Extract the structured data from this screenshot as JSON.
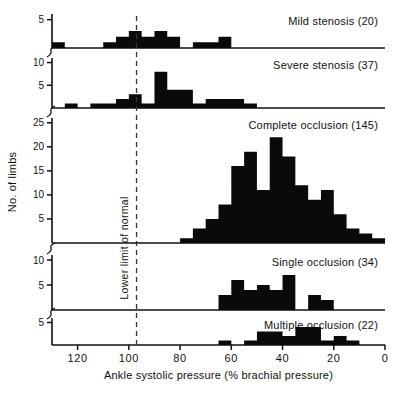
{
  "figure": {
    "ylabel": "No. of limbs",
    "xlabel": "Ankle systolic pressure (% brachial pressure)",
    "normal_limit_label": "Lower limit of normal",
    "normal_limit_value": 97
  },
  "chart_data": {
    "type": "bar",
    "title": "",
    "xlabel": "Ankle systolic pressure (% brachial pressure)",
    "ylabel": "No. of limbs",
    "xlim": [
      130,
      0
    ],
    "x_reversed": true,
    "xticks": [
      120,
      100,
      80,
      60,
      40,
      20,
      0
    ],
    "xticklabels": [
      "120",
      "100",
      "80",
      "60",
      "40",
      "20",
      "0"
    ],
    "grid": false,
    "legend": "none",
    "bin_width": 5,
    "annotations": [
      {
        "text": "Lower limit of normal",
        "x": 97,
        "style": "dashed-vertical-line"
      }
    ],
    "panels": [
      {
        "name": "mild-stenosis",
        "label": "Mild stenosis (20)",
        "count": 20,
        "ylim": [
          0,
          6
        ],
        "yticks": [
          5
        ],
        "yticklabels": [
          "5"
        ],
        "bins": [
          {
            "x0": 130,
            "x1": 125,
            "value": 1
          },
          {
            "x0": 125,
            "x1": 120,
            "value": 0
          },
          {
            "x0": 120,
            "x1": 115,
            "value": 0
          },
          {
            "x0": 115,
            "x1": 110,
            "value": 0
          },
          {
            "x0": 110,
            "x1": 105,
            "value": 1
          },
          {
            "x0": 105,
            "x1": 100,
            "value": 2
          },
          {
            "x0": 100,
            "x1": 95,
            "value": 3
          },
          {
            "x0": 95,
            "x1": 90,
            "value": 2
          },
          {
            "x0": 90,
            "x1": 85,
            "value": 3
          },
          {
            "x0": 85,
            "x1": 80,
            "value": 2
          },
          {
            "x0": 80,
            "x1": 75,
            "value": 0
          },
          {
            "x0": 75,
            "x1": 70,
            "value": 1
          },
          {
            "x0": 70,
            "x1": 65,
            "value": 1
          },
          {
            "x0": 65,
            "x1": 60,
            "value": 2
          },
          {
            "x0": 60,
            "x1": 55,
            "value": 0
          }
        ]
      },
      {
        "name": "severe-stenosis",
        "label": "Severe stenosis (37)",
        "count": 37,
        "ylim": [
          0,
          11
        ],
        "yticks": [
          5,
          10
        ],
        "yticklabels": [
          "5",
          "10"
        ],
        "bins": [
          {
            "x0": 125,
            "x1": 120,
            "value": 1
          },
          {
            "x0": 120,
            "x1": 115,
            "value": 0
          },
          {
            "x0": 115,
            "x1": 110,
            "value": 1
          },
          {
            "x0": 110,
            "x1": 105,
            "value": 1
          },
          {
            "x0": 105,
            "x1": 100,
            "value": 2
          },
          {
            "x0": 100,
            "x1": 95,
            "value": 3
          },
          {
            "x0": 95,
            "x1": 90,
            "value": 1
          },
          {
            "x0": 90,
            "x1": 85,
            "value": 8
          },
          {
            "x0": 85,
            "x1": 80,
            "value": 4
          },
          {
            "x0": 80,
            "x1": 75,
            "value": 4
          },
          {
            "x0": 75,
            "x1": 70,
            "value": 1
          },
          {
            "x0": 70,
            "x1": 65,
            "value": 2
          },
          {
            "x0": 65,
            "x1": 60,
            "value": 2
          },
          {
            "x0": 60,
            "x1": 55,
            "value": 2
          },
          {
            "x0": 55,
            "x1": 50,
            "value": 1
          }
        ]
      },
      {
        "name": "complete-occlusion",
        "label": "Complete occlusion (145)",
        "count": 145,
        "ylim": [
          0,
          26
        ],
        "yticks": [
          5,
          10,
          15,
          20,
          25
        ],
        "yticklabels": [
          "5",
          "10",
          "15",
          "20",
          "25"
        ],
        "bins": [
          {
            "x0": 80,
            "x1": 75,
            "value": 1
          },
          {
            "x0": 75,
            "x1": 70,
            "value": 3
          },
          {
            "x0": 70,
            "x1": 65,
            "value": 5
          },
          {
            "x0": 65,
            "x1": 60,
            "value": 8
          },
          {
            "x0": 60,
            "x1": 55,
            "value": 16
          },
          {
            "x0": 55,
            "x1": 50,
            "value": 19
          },
          {
            "x0": 50,
            "x1": 45,
            "value": 11
          },
          {
            "x0": 45,
            "x1": 40,
            "value": 22
          },
          {
            "x0": 40,
            "x1": 35,
            "value": 18
          },
          {
            "x0": 35,
            "x1": 30,
            "value": 12
          },
          {
            "x0": 30,
            "x1": 25,
            "value": 9
          },
          {
            "x0": 25,
            "x1": 20,
            "value": 11
          },
          {
            "x0": 20,
            "x1": 15,
            "value": 6
          },
          {
            "x0": 15,
            "x1": 10,
            "value": 3
          },
          {
            "x0": 10,
            "x1": 5,
            "value": 2
          },
          {
            "x0": 5,
            "x1": 0,
            "value": 1
          }
        ]
      },
      {
        "name": "single-occlusion",
        "label": "Single occlusion (34)",
        "count": 34,
        "ylim": [
          0,
          11
        ],
        "yticks": [
          5,
          10
        ],
        "yticklabels": [
          "5",
          "10"
        ],
        "bins": [
          {
            "x0": 65,
            "x1": 60,
            "value": 3
          },
          {
            "x0": 60,
            "x1": 55,
            "value": 6
          },
          {
            "x0": 55,
            "x1": 50,
            "value": 4
          },
          {
            "x0": 50,
            "x1": 45,
            "value": 5
          },
          {
            "x0": 45,
            "x1": 40,
            "value": 4
          },
          {
            "x0": 40,
            "x1": 35,
            "value": 7
          },
          {
            "x0": 35,
            "x1": 30,
            "value": 0
          },
          {
            "x0": 30,
            "x1": 25,
            "value": 3
          },
          {
            "x0": 25,
            "x1": 20,
            "value": 2
          }
        ]
      },
      {
        "name": "multiple-occlusion",
        "label": "Multiple occlusion (22)",
        "count": 22,
        "ylim": [
          0,
          6
        ],
        "yticks": [
          5
        ],
        "yticklabels": [
          "5"
        ],
        "bins": [
          {
            "x0": 65,
            "x1": 60,
            "value": 1
          },
          {
            "x0": 60,
            "x1": 55,
            "value": 0
          },
          {
            "x0": 55,
            "x1": 50,
            "value": 1
          },
          {
            "x0": 50,
            "x1": 45,
            "value": 3
          },
          {
            "x0": 45,
            "x1": 40,
            "value": 3
          },
          {
            "x0": 40,
            "x1": 35,
            "value": 2
          },
          {
            "x0": 35,
            "x1": 30,
            "value": 4
          },
          {
            "x0": 30,
            "x1": 25,
            "value": 4
          },
          {
            "x0": 25,
            "x1": 20,
            "value": 1
          },
          {
            "x0": 20,
            "x1": 15,
            "value": 2
          },
          {
            "x0": 15,
            "x1": 10,
            "value": 1
          },
          {
            "x0": 10,
            "x1": 5,
            "value": 0
          }
        ]
      }
    ]
  }
}
